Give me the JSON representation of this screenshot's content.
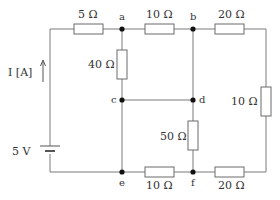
{
  "diagram": {
    "type": "circuit",
    "source": {
      "voltage_label": "5 V",
      "current_label": "I [A]"
    },
    "nodes": [
      "a",
      "b",
      "c",
      "d",
      "e",
      "f"
    ],
    "resistors": [
      {
        "id": "r_top_left",
        "label": "5 Ω",
        "between": [
          "source+",
          "a"
        ]
      },
      {
        "id": "r_ab",
        "label": "10 Ω",
        "between": [
          "a",
          "b"
        ]
      },
      {
        "id": "r_top_right",
        "label": "20 Ω",
        "between": [
          "b",
          "right"
        ]
      },
      {
        "id": "r_ac",
        "label": "40 Ω",
        "between": [
          "a",
          "c"
        ]
      },
      {
        "id": "r_right",
        "label": "10 Ω",
        "between": [
          "right-top",
          "right-bottom"
        ]
      },
      {
        "id": "r_df",
        "label": "50 Ω",
        "between": [
          "d",
          "f"
        ]
      },
      {
        "id": "r_ef",
        "label": "10 Ω",
        "between": [
          "e",
          "f"
        ]
      },
      {
        "id": "r_bottom_right",
        "label": "20 Ω",
        "between": [
          "f",
          "right"
        ]
      }
    ],
    "wires_note": "b–d direct wire, c–d direct wire, c–e direct wire"
  }
}
